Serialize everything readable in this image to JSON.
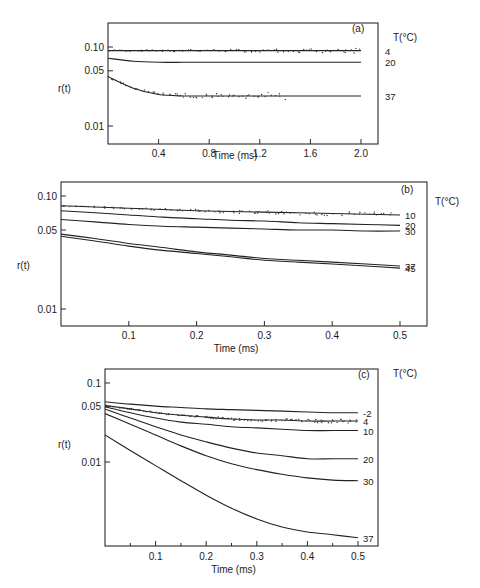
{
  "chart_data": [
    {
      "type": "line",
      "panel": "(a)",
      "xlabel": "Time (ms)",
      "ylabel": "r(t)",
      "yscale": "log",
      "xlim": [
        0,
        2.1
      ],
      "ylim": [
        0.006,
        0.14
      ],
      "xticks": [
        0.4,
        0.8,
        1.2,
        1.6,
        2.0
      ],
      "xtick_labels": [
        "0.4",
        "0.8",
        "1.2",
        "1.6",
        "2.0"
      ],
      "yticks": [
        0.1,
        0.05,
        0.01
      ],
      "ytick_labels": [
        "0.10",
        "0.05",
        "0.01"
      ],
      "legend_title": "T(°C)",
      "x": [
        0,
        0.2,
        0.4,
        0.6,
        0.8,
        1.0,
        1.2,
        1.4,
        1.6,
        1.8,
        2.0
      ],
      "series": [
        {
          "name": "4",
          "values": [
            0.09,
            0.09,
            0.09,
            0.09,
            0.09,
            0.09,
            0.09,
            0.09,
            0.09,
            0.09,
            0.09
          ],
          "has_data_points": true
        },
        {
          "name": "20",
          "values": [
            0.072,
            0.066,
            0.064,
            0.064,
            0.064,
            0.064,
            0.064,
            0.064,
            0.064,
            0.064,
            0.064
          ],
          "has_data_points": false
        },
        {
          "name": "37",
          "values": [
            0.042,
            0.03,
            0.025,
            0.024,
            0.024,
            0.024,
            0.024,
            0.024,
            0.024,
            0.024,
            0.024
          ],
          "has_data_points": true
        }
      ]
    },
    {
      "type": "line",
      "panel": "(b)",
      "xlabel": "Time (ms)",
      "ylabel": "r(t)",
      "yscale": "log",
      "xlim": [
        0,
        0.54
      ],
      "ylim": [
        0.0065,
        0.13
      ],
      "xticks": [
        0.1,
        0.2,
        0.3,
        0.4,
        0.5
      ],
      "xtick_labels": [
        "0.1",
        "0.2",
        "0.3",
        "0.4",
        "0.5"
      ],
      "yticks": [
        0.1,
        0.05,
        0.01
      ],
      "ytick_labels": [
        "0.10",
        "0.05",
        "0.01"
      ],
      "legend_title": "T(°C)",
      "x": [
        0,
        0.05,
        0.1,
        0.15,
        0.2,
        0.25,
        0.3,
        0.35,
        0.4,
        0.45,
        0.5
      ],
      "series": [
        {
          "name": "10",
          "values": [
            0.082,
            0.08,
            0.078,
            0.076,
            0.074,
            0.073,
            0.072,
            0.071,
            0.07,
            0.069,
            0.068
          ],
          "has_data_points": true
        },
        {
          "name": "20",
          "values": [
            0.074,
            0.071,
            0.068,
            0.065,
            0.063,
            0.061,
            0.06,
            0.058,
            0.057,
            0.056,
            0.055
          ],
          "has_data_points": false
        },
        {
          "name": "30",
          "values": [
            0.062,
            0.059,
            0.056,
            0.054,
            0.053,
            0.052,
            0.051,
            0.05,
            0.05,
            0.049,
            0.049
          ],
          "has_data_points": false
        },
        {
          "name": "37",
          "values": [
            0.046,
            0.042,
            0.038,
            0.035,
            0.032,
            0.03,
            0.028,
            0.027,
            0.026,
            0.025,
            0.024
          ],
          "has_data_points": false
        },
        {
          "name": "45",
          "values": [
            0.044,
            0.04,
            0.036,
            0.033,
            0.031,
            0.029,
            0.027,
            0.026,
            0.025,
            0.024,
            0.023
          ],
          "has_data_points": false
        }
      ]
    },
    {
      "type": "line",
      "panel": "(c)",
      "xlabel": "Time (ms)",
      "ylabel": "r(t)",
      "yscale": "log",
      "xlim": [
        0,
        0.54
      ],
      "ylim": [
        0.0011,
        0.13
      ],
      "xticks": [
        0.1,
        0.2,
        0.3,
        0.4,
        0.5
      ],
      "xtick_labels": [
        "0.1",
        "0.2",
        "0.3",
        "0.4",
        "0.5"
      ],
      "yticks": [
        0.1,
        0.05,
        0.01
      ],
      "ytick_labels": [
        "0.1",
        "0.05",
        "0.01"
      ],
      "legend_title": "T(°C)",
      "x": [
        0,
        0.05,
        0.1,
        0.15,
        0.2,
        0.25,
        0.3,
        0.35,
        0.4,
        0.45,
        0.5
      ],
      "series": [
        {
          "name": "-2",
          "values": [
            0.058,
            0.054,
            0.051,
            0.049,
            0.047,
            0.046,
            0.045,
            0.044,
            0.043,
            0.042,
            0.042
          ],
          "has_data_points": false
        },
        {
          "name": "4",
          "values": [
            0.052,
            0.047,
            0.042,
            0.039,
            0.037,
            0.035,
            0.034,
            0.034,
            0.033,
            0.033,
            0.033
          ],
          "has_data_points": true
        },
        {
          "name": "10",
          "values": [
            0.05,
            0.042,
            0.036,
            0.032,
            0.03,
            0.028,
            0.027,
            0.026,
            0.025,
            0.025,
            0.025
          ],
          "has_data_points": false
        },
        {
          "name": "20",
          "values": [
            0.047,
            0.036,
            0.028,
            0.022,
            0.018,
            0.015,
            0.013,
            0.012,
            0.011,
            0.011,
            0.011
          ],
          "has_data_points": false
        },
        {
          "name": "30",
          "values": [
            0.041,
            0.03,
            0.022,
            0.016,
            0.012,
            0.0095,
            0.008,
            0.007,
            0.0063,
            0.0059,
            0.0058
          ],
          "has_data_points": false
        },
        {
          "name": "37",
          "values": [
            0.022,
            0.014,
            0.009,
            0.0058,
            0.0038,
            0.0026,
            0.0019,
            0.0015,
            0.0013,
            0.0012,
            0.0011
          ],
          "has_data_points": false
        }
      ]
    }
  ]
}
